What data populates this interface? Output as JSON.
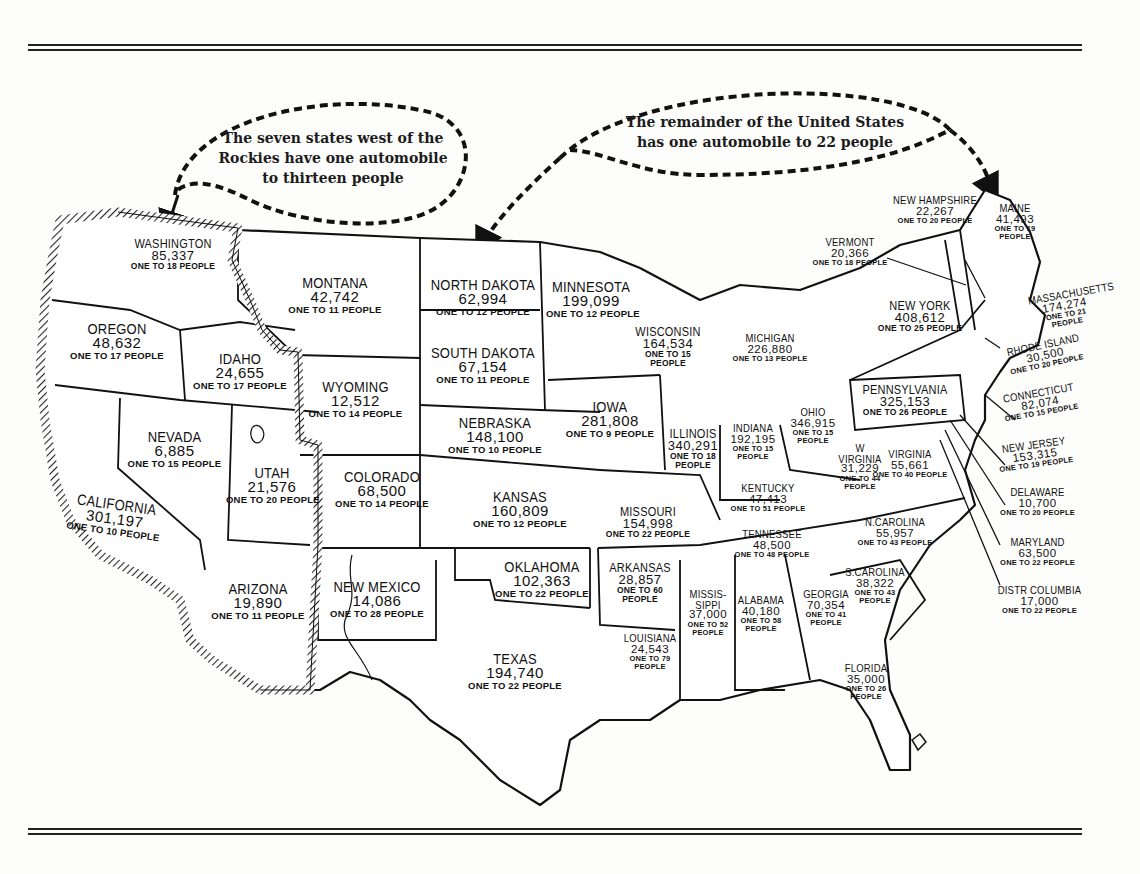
{
  "callouts": {
    "west": "The seven states west of the Rockies have one automobile to thirteen people",
    "west_lines": [
      "The seven states west of the",
      "Rockies have one automobile",
      "to thirteen people"
    ],
    "rest": "The remainder of the United States has one automobile to 22 people",
    "rest_lines": [
      "The remainder of the United States",
      "has one automobile to 22 people"
    ]
  },
  "colors": {
    "ink": "#1a1a1a",
    "paper": "#fdfdfc",
    "west_border_hatch": "#333333"
  },
  "states": [
    {
      "id": "washington",
      "name": "WASHINGTON",
      "cars": "85,337",
      "ratio": "ONE TO 18 PEOPLE"
    },
    {
      "id": "oregon",
      "name": "OREGON",
      "cars": "48,632",
      "ratio": "ONE TO 17 PEOPLE"
    },
    {
      "id": "idaho",
      "name": "IDAHO",
      "cars": "24,655",
      "ratio": "ONE TO 17 PEOPLE"
    },
    {
      "id": "montana",
      "name": "MONTANA",
      "cars": "42,742",
      "ratio": "ONE TO 11 PEOPLE"
    },
    {
      "id": "wyoming",
      "name": "WYOMING",
      "cars": "12,512",
      "ratio": "ONE TO 14 PEOPLE"
    },
    {
      "id": "nevada",
      "name": "NEVADA",
      "cars": "6,885",
      "ratio": "ONE TO 15 PEOPLE"
    },
    {
      "id": "utah",
      "name": "UTAH",
      "cars": "21,576",
      "ratio": "ONE TO 20 PEOPLE"
    },
    {
      "id": "california",
      "name": "CALIFORNIA",
      "cars": "301,197",
      "ratio": "ONE TO 10 PEOPLE"
    },
    {
      "id": "arizona",
      "name": "ARIZONA",
      "cars": "19,890",
      "ratio": "ONE TO 11 PEOPLE"
    },
    {
      "id": "colorado",
      "name": "COLORADO",
      "cars": "68,500",
      "ratio": "ONE TO 14 PEOPLE"
    },
    {
      "id": "new-mexico",
      "name": "NEW MEXICO",
      "cars": "14,086",
      "ratio": "ONE TO 28 PEOPLE"
    },
    {
      "id": "north-dakota",
      "name": "NORTH DAKOTA",
      "cars": "62,994",
      "ratio": "ONE TO 12 PEOPLE"
    },
    {
      "id": "south-dakota",
      "name": "SOUTH DAKOTA",
      "cars": "67,154",
      "ratio": "ONE TO 11 PEOPLE"
    },
    {
      "id": "nebraska",
      "name": "NEBRASKA",
      "cars": "148,100",
      "ratio": "ONE TO 10 PEOPLE"
    },
    {
      "id": "kansas",
      "name": "KANSAS",
      "cars": "160,809",
      "ratio": "ONE TO 12 PEOPLE"
    },
    {
      "id": "oklahoma",
      "name": "OKLAHOMA",
      "cars": "102,363",
      "ratio": "ONE TO 22 PEOPLE"
    },
    {
      "id": "texas",
      "name": "TEXAS",
      "cars": "194,740",
      "ratio": "ONE TO 22 PEOPLE"
    },
    {
      "id": "minnesota",
      "name": "MINNESOTA",
      "cars": "199,099",
      "ratio": "ONE TO 12 PEOPLE"
    },
    {
      "id": "iowa",
      "name": "IOWA",
      "cars": "281,808",
      "ratio": "ONE TO 9 PEOPLE"
    },
    {
      "id": "missouri",
      "name": "MISSOURI",
      "cars": "154,998",
      "ratio": "ONE TO 22 PEOPLE"
    },
    {
      "id": "arkansas",
      "name": "ARKANSAS",
      "cars": "28,857",
      "ratio": "ONE TO 60 PEOPLE"
    },
    {
      "id": "louisiana",
      "name": "LOUISIANA",
      "cars": "24,543",
      "ratio": "ONE TO 79 PEOPLE"
    },
    {
      "id": "wisconsin",
      "name": "WISCONSIN",
      "cars": "164,534",
      "ratio": "ONE TO 15 PEOPLE"
    },
    {
      "id": "illinois",
      "name": "ILLINOIS",
      "cars": "340,291",
      "ratio": "ONE TO 18 PEOPLE"
    },
    {
      "id": "michigan",
      "name": "MICHIGAN",
      "cars": "226,880",
      "ratio": "ONE TO 13 PEOPLE"
    },
    {
      "id": "indiana",
      "name": "INDIANA",
      "cars": "192,195",
      "ratio": "ONE TO 15 PEOPLE"
    },
    {
      "id": "ohio",
      "name": "OHIO",
      "cars": "346,915",
      "ratio": "ONE TO 15 PEOPLE"
    },
    {
      "id": "kentucky",
      "name": "KENTUCKY",
      "cars": "47,413",
      "ratio": "ONE TO 51 PEOPLE"
    },
    {
      "id": "tennessee",
      "name": "TENNESSEE",
      "cars": "48,500",
      "ratio": "ONE TO 48 PEOPLE"
    },
    {
      "id": "mississippi",
      "name": "MISSIS-SIPPI",
      "cars": "37,000",
      "ratio": "ONE TO 52 PEOPLE"
    },
    {
      "id": "alabama",
      "name": "ALABAMA",
      "cars": "40,180",
      "ratio": "ONE TO 58 PEOPLE"
    },
    {
      "id": "georgia",
      "name": "GEORGIA",
      "cars": "70,354",
      "ratio": "ONE TO 41 PEOPLE"
    },
    {
      "id": "florida",
      "name": "FLORIDA",
      "cars": "35,000",
      "ratio": "ONE TO 26 PEOPLE"
    },
    {
      "id": "south-carolina",
      "name": "S.CAROLINA",
      "cars": "38,322",
      "ratio": "ONE TO 43 PEOPLE"
    },
    {
      "id": "north-carolina",
      "name": "N.CAROLINA",
      "cars": "55,957",
      "ratio": "ONE TO 43 PEOPLE"
    },
    {
      "id": "virginia",
      "name": "VIRGINIA",
      "cars": "55,661",
      "ratio": "ONE TO 40 PEOPLE"
    },
    {
      "id": "west-virginia",
      "name": "W VIRGINIA",
      "cars": "31,229",
      "ratio": "ONE TO 44 PEOPLE"
    },
    {
      "id": "pennsylvania",
      "name": "PENNSYLVANIA",
      "cars": "325,153",
      "ratio": "ONE TO 26 PEOPLE"
    },
    {
      "id": "new-york",
      "name": "NEW YORK",
      "cars": "408,612",
      "ratio": "ONE TO 25 PEOPLE"
    },
    {
      "id": "vermont",
      "name": "VERMONT",
      "cars": "20,366",
      "ratio": "ONE TO 18 PEOPLE"
    },
    {
      "id": "new-hampshire",
      "name": "NEW HAMPSHIRE",
      "cars": "22,267",
      "ratio": "ONE TO 20 PEOPLE"
    },
    {
      "id": "maine",
      "name": "MAINE",
      "cars": "41,493",
      "ratio": "ONE TO 19 PEOPLE"
    },
    {
      "id": "massachusetts",
      "name": "MASSACHUSETTS",
      "cars": "174,274",
      "ratio": "ONE TO 21 PEOPLE"
    },
    {
      "id": "rhode-island",
      "name": "RHODE ISLAND",
      "cars": "30,500",
      "ratio": "ONE TO 20 PEOPLE"
    },
    {
      "id": "connecticut",
      "name": "CONNECTICUT",
      "cars": "82,074",
      "ratio": "ONE TO 15 PEOPLE"
    },
    {
      "id": "new-jersey",
      "name": "NEW JERSEY",
      "cars": "153,315",
      "ratio": "ONE TO 19 PEOPLE"
    },
    {
      "id": "delaware",
      "name": "DELAWARE",
      "cars": "10,700",
      "ratio": "ONE TO 20 PEOPLE"
    },
    {
      "id": "maryland",
      "name": "MARYLAND",
      "cars": "63,500",
      "ratio": "ONE TO 22 PEOPLE"
    },
    {
      "id": "district-of-columbia",
      "name": "DISTR COLUMBIA",
      "cars": "17,000",
      "ratio": "ONE TO 22 PEOPLE"
    }
  ]
}
